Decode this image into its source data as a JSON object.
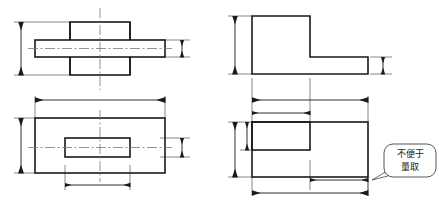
{
  "drawing": {
    "title": "",
    "sheet_size": {
      "width": 439,
      "height": 203
    },
    "background_color": "#ffffff",
    "line_color": "#1a1a1a",
    "thin_line_color": "#555555",
    "center_line_color": "#777777",
    "annotation": {
      "text_line1": "不便于",
      "text_line2": "量取",
      "full_text": "不便于量取",
      "meaning_label": "",
      "balloon_stroke": "#444444",
      "balloon_fill": "#ffffff"
    },
    "views": [
      {
        "id": "top-left-view",
        "name": "front-view-incorrect",
        "description": "cross-shaped front view with horizontal bar and vertical block",
        "dimensions": [
          {
            "name": "overall-height",
            "orientation": "vertical",
            "position": "left",
            "value": ""
          },
          {
            "name": "bar-thickness",
            "orientation": "vertical",
            "position": "right",
            "value": ""
          }
        ]
      },
      {
        "id": "top-right-view",
        "name": "front-view-correct",
        "description": "L-shaped front view with vertical block and horizontal base",
        "dimensions": [
          {
            "name": "overall-height",
            "orientation": "vertical",
            "position": "left",
            "value": ""
          },
          {
            "name": "base-thickness",
            "orientation": "vertical",
            "position": "right",
            "value": ""
          },
          {
            "name": "block-width",
            "orientation": "horizontal",
            "position": "bottom",
            "value": ""
          }
        ]
      },
      {
        "id": "bottom-left-view",
        "name": "top-view-incorrect",
        "description": "top view rectangle with centered inner rectangle",
        "dimensions": [
          {
            "name": "overall-length",
            "orientation": "horizontal",
            "position": "top",
            "value": ""
          },
          {
            "name": "overall-width",
            "orientation": "vertical",
            "position": "left",
            "value": ""
          },
          {
            "name": "inner-width",
            "orientation": "vertical",
            "position": "right",
            "value": ""
          },
          {
            "name": "inner-length",
            "orientation": "horizontal",
            "position": "bottom",
            "value": ""
          }
        ]
      },
      {
        "id": "bottom-right-view",
        "name": "top-view-correct",
        "description": "top view rectangle with inner rectangle at upper-left corner",
        "dimensions": [
          {
            "name": "overall-length",
            "orientation": "horizontal",
            "position": "top",
            "value": ""
          },
          {
            "name": "notch-length",
            "orientation": "horizontal",
            "position": "top-inner",
            "value": ""
          },
          {
            "name": "overall-width",
            "orientation": "vertical",
            "position": "left-outer",
            "value": ""
          },
          {
            "name": "notch-width",
            "orientation": "vertical",
            "position": "left-inner",
            "value": ""
          },
          {
            "name": "remaining-length",
            "orientation": "horizontal",
            "position": "bottom-inner",
            "value": ""
          },
          {
            "name": "base-length",
            "orientation": "horizontal",
            "position": "bottom",
            "value": ""
          }
        ]
      }
    ]
  }
}
